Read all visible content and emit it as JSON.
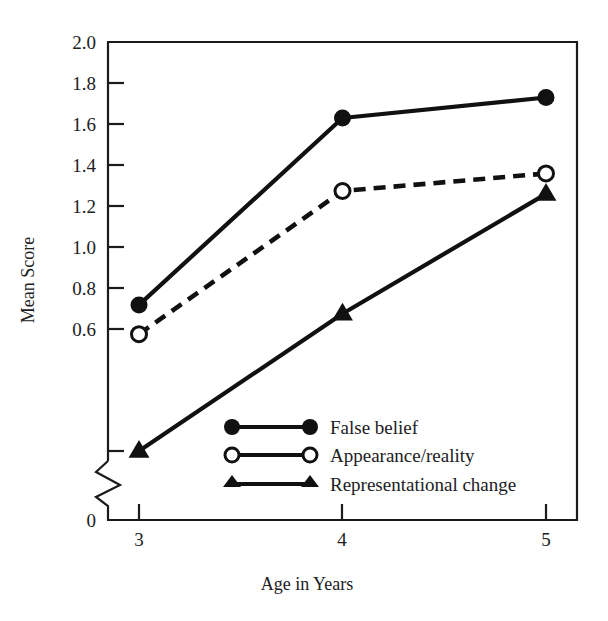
{
  "chart_data": {
    "type": "line",
    "title": "",
    "xlabel": "Age in Years",
    "ylabel": "Mean Score",
    "x": [
      3,
      4,
      5
    ],
    "xtick_labels": [
      "3",
      "4",
      "5"
    ],
    "ytick_labels": [
      "2.0",
      "1.8",
      "1.6",
      "1.4",
      "1.2",
      "1.0",
      "0.8",
      "0.6",
      "0"
    ],
    "ytick_values": [
      2.0,
      1.8,
      1.6,
      1.4,
      1.2,
      1.0,
      0.8,
      0.6,
      0
    ],
    "ylim": [
      0.6,
      2.0
    ],
    "xlim": [
      3,
      5
    ],
    "axis_break": true,
    "axis_break_between": [
      0.6,
      0
    ],
    "grid": false,
    "legend_position": "inside-lower-center",
    "series": [
      {
        "name": "False belief",
        "values": [
          1.1,
          1.74,
          1.81
        ],
        "marker": "filled-circle",
        "linestyle": "solid",
        "color": "#111111"
      },
      {
        "name": "Appearance/reality",
        "values": [
          1.0,
          1.49,
          1.55
        ],
        "marker": "open-circle",
        "linestyle": "dashed",
        "color": "#111111"
      },
      {
        "name": "Representational change",
        "values": [
          0.6,
          1.07,
          1.48
        ],
        "marker": "filled-triangle",
        "linestyle": "solid",
        "color": "#111111"
      }
    ]
  },
  "axes": {
    "y_title": "Mean Score",
    "x_title": "Age in Years",
    "zero_label": "0"
  },
  "ticks": {
    "y": [
      "2.0",
      "1.8",
      "1.6",
      "1.4",
      "1.2",
      "1.0",
      "0.8",
      "0.6"
    ],
    "x": [
      "3",
      "4",
      "5"
    ]
  },
  "legend": {
    "items": [
      {
        "label": "False belief"
      },
      {
        "label": "Appearance/reality"
      },
      {
        "label": "Representational change"
      }
    ]
  },
  "colors": {
    "ink": "#111111",
    "background": "#ffffff"
  }
}
